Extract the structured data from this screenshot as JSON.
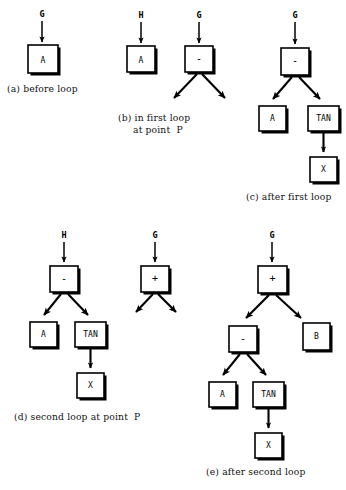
{
  "figure": {
    "title_caption_style": "lettered-subfigures",
    "panels": [
      {
        "id": "a",
        "caption": "(a) before loop",
        "inputs": [
          {
            "label": "G"
          }
        ],
        "nodes": [
          {
            "id": "a1",
            "label": "A"
          }
        ],
        "edges": []
      },
      {
        "id": "b",
        "caption_line1": "(b) in first loop",
        "caption_line2": "at point  P",
        "inputs": [
          {
            "label": "H"
          },
          {
            "label": "G"
          }
        ],
        "nodes": [
          {
            "id": "b1",
            "label": "A"
          },
          {
            "id": "b2",
            "label": "-"
          }
        ],
        "dangling_children": 2
      },
      {
        "id": "c",
        "caption": "(c) after first loop",
        "inputs": [
          {
            "label": "G"
          }
        ],
        "nodes": [
          {
            "id": "c1",
            "label": "-"
          },
          {
            "id": "c2",
            "label": "A"
          },
          {
            "id": "c3",
            "label": "TAN"
          },
          {
            "id": "c4",
            "label": "X"
          }
        ],
        "edges": [
          [
            "c1",
            "c2"
          ],
          [
            "c1",
            "c3"
          ],
          [
            "c3",
            "c4"
          ]
        ]
      },
      {
        "id": "d",
        "caption": "(d) second loop at point  P",
        "inputs": [
          {
            "label": "H"
          },
          {
            "label": "G"
          }
        ],
        "nodes": [
          {
            "id": "d1",
            "label": "-"
          },
          {
            "id": "d2",
            "label": "A"
          },
          {
            "id": "d3",
            "label": "TAN"
          },
          {
            "id": "d4",
            "label": "X"
          },
          {
            "id": "d5",
            "label": "+"
          }
        ],
        "edges": [
          [
            "d1",
            "d2"
          ],
          [
            "d1",
            "d3"
          ],
          [
            "d3",
            "d4"
          ]
        ],
        "dangling_children": 2
      },
      {
        "id": "e",
        "caption": "(e) after second loop",
        "inputs": [
          {
            "label": "G"
          }
        ],
        "nodes": [
          {
            "id": "e1",
            "label": "+"
          },
          {
            "id": "e2",
            "label": "-"
          },
          {
            "id": "e3",
            "label": "B"
          },
          {
            "id": "e4",
            "label": "A"
          },
          {
            "id": "e5",
            "label": "TAN"
          },
          {
            "id": "e6",
            "label": "X"
          }
        ],
        "edges": [
          [
            "e1",
            "e2"
          ],
          [
            "e1",
            "e3"
          ],
          [
            "e2",
            "e4"
          ],
          [
            "e2",
            "e5"
          ],
          [
            "e5",
            "e6"
          ]
        ]
      }
    ]
  },
  "colors": {
    "ink": "#000000",
    "paper": "#ffffff"
  }
}
